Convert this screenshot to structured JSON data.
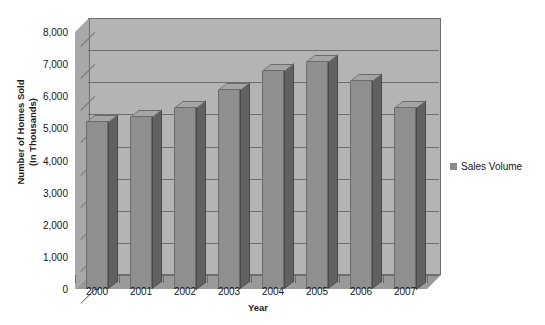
{
  "chart_data": {
    "type": "bar",
    "title": "",
    "xlabel": "Year",
    "ylabel": "Number of Homes Sold (In Thousands)",
    "ylabel_line1": "Number of Homes Sold",
    "ylabel_line2": "(In Thousands)",
    "categories": [
      "2000",
      "2001",
      "2002",
      "2003",
      "2004",
      "2005",
      "2006",
      "2007"
    ],
    "values": [
      5200,
      5350,
      5650,
      6180,
      6800,
      7080,
      6480,
      5650
    ],
    "series": [
      {
        "name": "Sales Volume",
        "values": [
          5200,
          5350,
          5650,
          6180,
          6800,
          7080,
          6480,
          5650
        ]
      }
    ],
    "ylim": [
      0,
      8000
    ],
    "ytick_values": [
      0,
      1000,
      2000,
      3000,
      4000,
      5000,
      6000,
      7000,
      8000
    ],
    "ytick_labels": [
      "0",
      "1,000",
      "2,000",
      "3,000",
      "4,000",
      "5,000",
      "6,000",
      "7,000",
      "8,000"
    ],
    "grid": true,
    "legend_position": "right",
    "legend_entries": [
      "Sales Volume"
    ],
    "style": "3d-bar",
    "colors": {
      "bar_front": "#8f8f8f",
      "bar_side": "#5e5e5e",
      "bar_top": "#a5a5a5",
      "plot_background": "#b4b4b4",
      "left_wall": "#a8a8a8",
      "floor": "#9a9a9a",
      "gridline": "#6e6e6e",
      "text": "#151515",
      "page_background": "#ffffff"
    }
  },
  "legend": {
    "swatch_name": "sales-volume-swatch",
    "label": "Sales Volume"
  },
  "axes": {
    "x_title": "Year",
    "y_title_line1": "Number of Homes Sold",
    "y_title_line2": "(In Thousands)"
  }
}
